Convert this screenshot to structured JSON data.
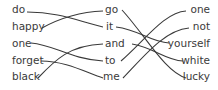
{
  "left_column": [
    "do",
    "happy",
    "one",
    "forget",
    "black"
  ],
  "middle_column": [
    "go",
    "it",
    "and",
    "to",
    "me"
  ],
  "right_column": [
    "one",
    "not",
    "yourself",
    "white",
    "lucky"
  ],
  "connections_left_to_middle": [
    {
      "from": "do",
      "to": "it"
    },
    {
      "from": "happy",
      "to": "go"
    },
    {
      "from": "one",
      "to": "to"
    },
    {
      "from": "forget",
      "to": "me"
    },
    {
      "from": "black",
      "to": "and"
    }
  ],
  "connections_middle_to_right": [
    {
      "from": "go",
      "to": "lucky"
    },
    {
      "from": "it",
      "to": "yourself"
    },
    {
      "from": "and",
      "to": "white"
    },
    {
      "from": "to",
      "to": "one"
    },
    {
      "from": "me",
      "to": "not"
    }
  ],
  "colors": {
    "line": "#3a3a3a",
    "text": "#3a3a3a",
    "background": "#ffffff"
  }
}
